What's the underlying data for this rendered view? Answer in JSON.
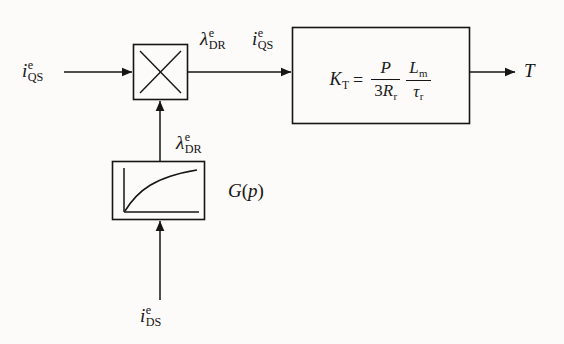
{
  "diagram": {
    "background_color": "#fcfbf9",
    "line_color": "#151515",
    "blocks": {
      "multiplier": {
        "name": "multiplier",
        "symbol": "X",
        "x": 133,
        "y": 44,
        "w": 55,
        "h": 56
      },
      "gain": {
        "name": "torque-constant-block",
        "x": 292,
        "y": 27,
        "w": 178,
        "h": 97,
        "equation": {
          "lhs": "K",
          "lhs_sub": "T",
          "equals": "=",
          "fraction1": {
            "numerator": "P",
            "denominator_coef": "3",
            "denominator_var": "R",
            "denominator_sub": "r"
          },
          "fraction2": {
            "numerator_var": "L",
            "numerator_sub": "m",
            "denominator_var": "τ",
            "denominator_sub": "r"
          }
        }
      },
      "saturation": {
        "name": "magnetizing-curve-block",
        "x": 112,
        "y": 161,
        "w": 93,
        "h": 59,
        "curve_description": "saturating concave rising curve",
        "label": {
          "fn": "G",
          "open": "(",
          "arg": "p",
          "close": ")"
        }
      }
    },
    "signals": {
      "input_left": {
        "base": "i",
        "sup": "e",
        "sub": "QS"
      },
      "mid_lambda": {
        "base": "λ",
        "sup": "e",
        "sub": "DR"
      },
      "mid_iqs": {
        "base": "i",
        "sup": "e",
        "sub": "QS"
      },
      "feedback_lambda": {
        "base": "λ",
        "sup": "e",
        "sub": "DR"
      },
      "input_bottom": {
        "base": "i",
        "sup": "e",
        "sub": "DS"
      },
      "output": {
        "base": "T"
      }
    }
  }
}
